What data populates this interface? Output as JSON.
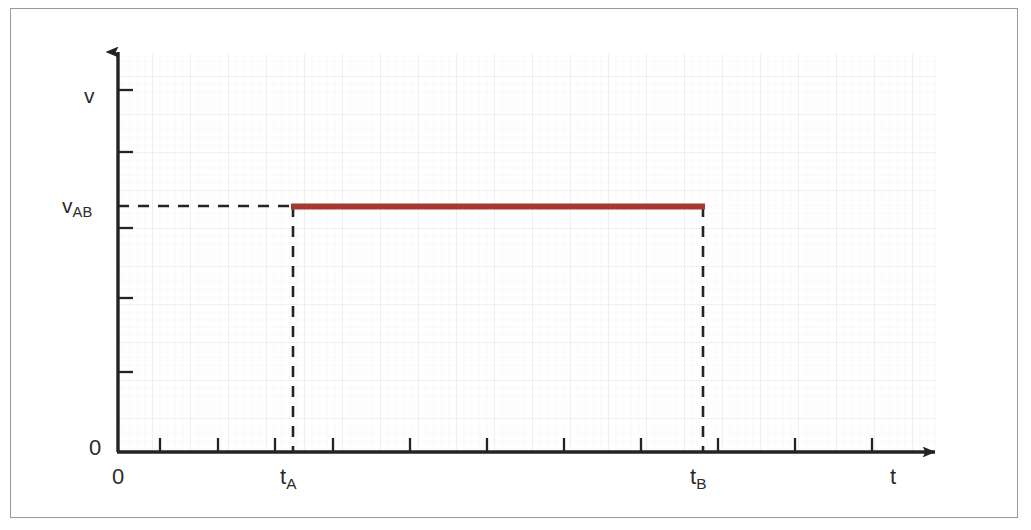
{
  "figure": {
    "kind": "waveform-plot",
    "frame_border_color": "#9a9a9e",
    "background_color": "#ffffff"
  },
  "labels": {
    "y_axis": "v",
    "y_value_main": "v",
    "y_value_sub": "AB",
    "x_axis": "t",
    "origin_y": "0",
    "origin_x": "0",
    "t_start_main": "t",
    "t_start_sub": "A",
    "t_end_main": "t",
    "t_end_sub": "B"
  },
  "chart_data": {
    "type": "line",
    "title": "",
    "xlabel": "t",
    "ylabel": "v",
    "subtitle": "",
    "series": [
      {
        "name": "v_AB(t)",
        "color": "#a33a32",
        "line_width": 5,
        "x": [
          "t_A",
          "t_B"
        ],
        "y": [
          "v_AB",
          "v_AB"
        ],
        "points": [
          {
            "x_label": "t_A",
            "y_label": "v_AB"
          },
          {
            "x_label": "t_B",
            "y_label": "v_AB"
          }
        ]
      }
    ],
    "guide_lines": [
      {
        "name": "v_AB-level",
        "orientation": "horizontal",
        "style": "dashed",
        "from": "y-axis",
        "to": "t_A",
        "value_label": "v_AB"
      },
      {
        "name": "t_A-drop",
        "orientation": "vertical",
        "style": "dashed",
        "from": "x-axis",
        "to": "v_AB",
        "value_label": "t_A"
      },
      {
        "name": "t_B-drop",
        "orientation": "vertical",
        "style": "dashed",
        "from": "x-axis",
        "to": "v_AB",
        "value_label": "t_B"
      }
    ],
    "x_tick_labels": [
      "0",
      "t_A",
      "t_B",
      "t"
    ],
    "y_tick_labels": [
      "0",
      "v_AB",
      "v"
    ],
    "xlim": [
      "0",
      "max"
    ],
    "ylim": [
      "0",
      "max"
    ],
    "grid": true,
    "grid_color": "#ebebee",
    "grid_minor_color": "#f4f4f6",
    "legend": "none",
    "axis_color": "#232323",
    "axis_style": "arrow-tipped",
    "x_tick_count": 11,
    "y_tick_count": 6
  },
  "geometry": {
    "origin_x_px": 118,
    "origin_y_px": 452,
    "x_axis_end_px": 948,
    "y_axis_top_px": 40,
    "level_y_px": 206,
    "t_a_px": 293,
    "t_b_px": 703
  }
}
